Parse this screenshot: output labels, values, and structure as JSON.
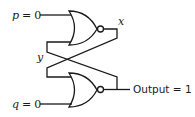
{
  "diagram": {
    "type": "SR latch (cross-coupled NOR gates)",
    "inputs": {
      "p": {
        "name": "p",
        "eq": "=",
        "value": "0"
      },
      "q": {
        "name": "q",
        "eq": "=",
        "value": "0"
      }
    },
    "nodes": {
      "x": "x",
      "y": "y"
    },
    "output": {
      "label": "Output",
      "eq": "=",
      "value": "1",
      "text": "Output = 1"
    },
    "gates": [
      {
        "id": "top-nor",
        "kind": "NOR",
        "inputs": [
          "p",
          "y-feedback"
        ],
        "output": "x"
      },
      {
        "id": "bottom-nor",
        "kind": "NOR",
        "inputs": [
          "x-feedback",
          "q"
        ],
        "output": "Output"
      }
    ]
  }
}
